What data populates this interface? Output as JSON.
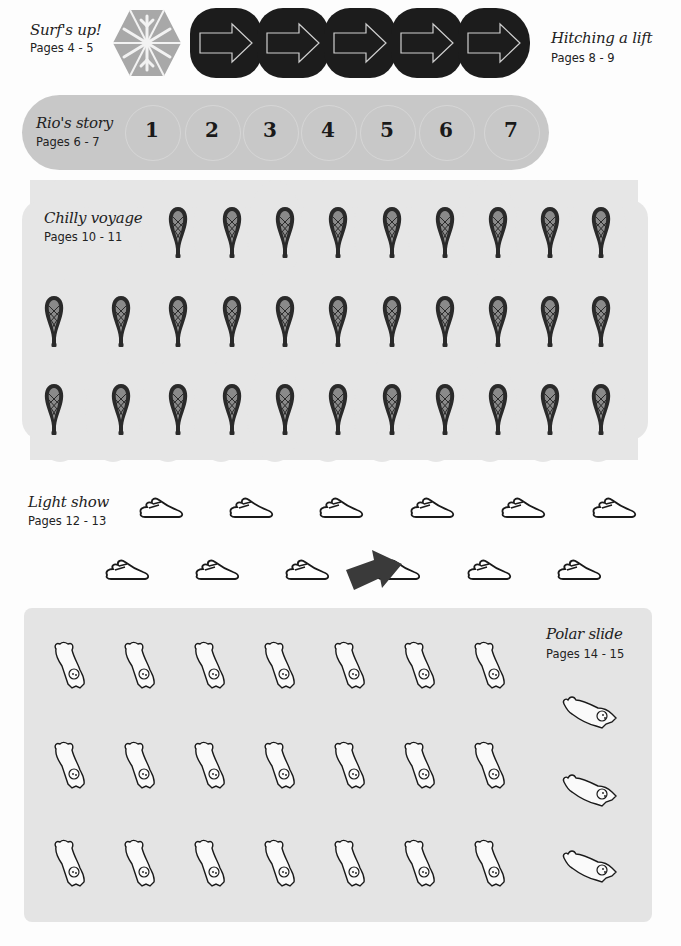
{
  "sections": {
    "surfs_up": {
      "title": "Surf's up!",
      "pages": "Pages 4 - 5",
      "tile_icons": [
        "snowflake-icon",
        "arrow-right-icon",
        "arrow-right-icon",
        "arrow-right-icon",
        "arrow-right-icon",
        "arrow-right-icon"
      ]
    },
    "hitching_a_lift": {
      "title": "Hitching a lift",
      "pages": "Pages 8 - 9"
    },
    "rios_story": {
      "title": "Rio's story",
      "pages": "Pages 6 - 7",
      "numbers": [
        "1",
        "2",
        "3",
        "4",
        "5",
        "6",
        "7"
      ]
    },
    "chilly_voyage": {
      "title": "Chilly voyage",
      "pages": "Pages 10 - 11",
      "sticker_icon": "snowshoe-icon",
      "rows": [
        9,
        11,
        11
      ]
    },
    "light_show": {
      "title": "Light show",
      "pages": "Pages 12 - 13",
      "sticker_icon": "footprint-icon",
      "rows": [
        6,
        6
      ]
    },
    "polar_slide": {
      "title": "Polar slide",
      "pages": "Pages 14 - 15",
      "sticker_icon": "polar-bear-icon",
      "grid_rows": 3,
      "grid_cols": 7,
      "side_bears": 3
    }
  },
  "colors": {
    "page_bg": "#fdfdfd",
    "hex_tile": "#a8a8a8",
    "arrow_tile": "#1c1c1c",
    "rio_strip": "#c8c8c8",
    "chilly_bg": "#e6e6e6",
    "polar_bg": "#e4e4e4"
  }
}
